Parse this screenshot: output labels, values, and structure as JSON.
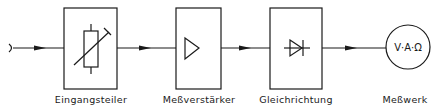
{
  "diagram": {
    "blocks": [
      {
        "id": "eingangsteiler",
        "label": "Eingangsteiler",
        "symbol": "variable-resistor"
      },
      {
        "id": "messverstaerker",
        "label": "Meßverstärker",
        "symbol": "amplifier-triangle"
      },
      {
        "id": "gleichrichtung",
        "label": "Gleichrichtung",
        "symbol": "diode"
      },
      {
        "id": "messwerk",
        "label": "Meßwerk",
        "symbol": "meter-circle",
        "inner_text": "V·A·Ω"
      }
    ],
    "flow": [
      "input",
      "eingangsteiler",
      "messverstaerker",
      "gleichrichtung",
      "messwerk"
    ],
    "colors": {
      "line": "#1a1a1a",
      "background": "#ffffff"
    }
  }
}
